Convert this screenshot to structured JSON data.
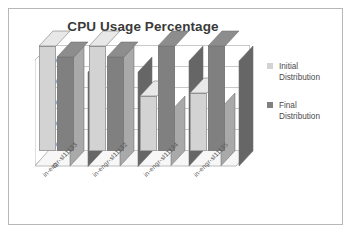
{
  "chart_data": {
    "type": "bar",
    "title": "CPU Usage Percentage",
    "xlabel": "",
    "ylabel": "",
    "categories": [
      "in-engr-sl11133",
      "in-engr-sl11132",
      "in-engr-sl11134",
      "in-engr-sl11135"
    ],
    "series": [
      {
        "name": "Initial Distribution",
        "values": [
          100,
          100,
          52,
          55
        ],
        "color": "#d3d3d3"
      },
      {
        "name": "Final Distribution",
        "values": [
          90,
          90,
          100,
          100
        ],
        "color": "#808080"
      }
    ],
    "ylim": [
      0,
      100
    ],
    "yticks": [
      0,
      20,
      40,
      60,
      80,
      100
    ],
    "ytick_labels": [
      "0",
      "20",
      "40",
      "60",
      "80",
      "100"
    ],
    "grid": true,
    "grid_axis": "y",
    "legend_position": "right",
    "style": "3d-clustered-column"
  },
  "legend": {
    "items": [
      {
        "label_line1": "Initial",
        "label_line2": "Distribution",
        "color": "#d3d3d3"
      },
      {
        "label_line1": "Final",
        "label_line2": "Distribution",
        "color": "#808080"
      }
    ]
  },
  "colors": {
    "border": "#b7b7b7",
    "title_text": "#3a3a3a",
    "axis_text": "#595959",
    "gridline": "#c9c9c9",
    "series_initial": "#d3d3d3",
    "series_final": "#808080",
    "floor": "#f2f2f2"
  }
}
